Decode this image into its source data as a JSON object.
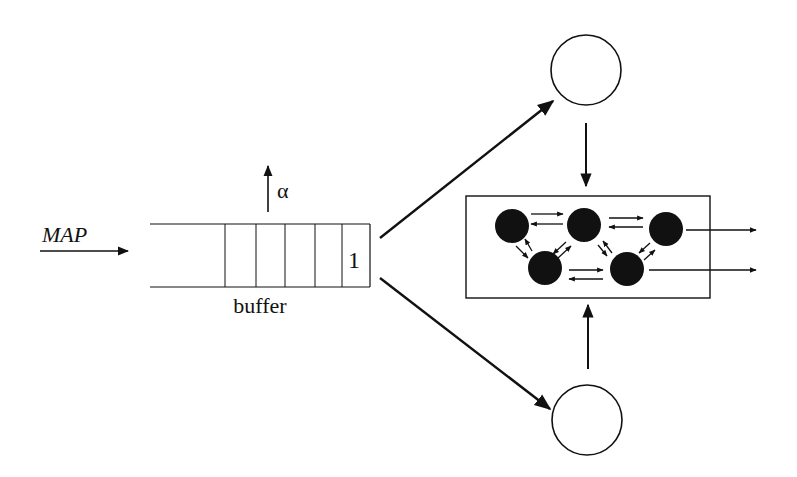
{
  "diagram": {
    "input_label": "MAP",
    "abandon_label": "α",
    "buffer_label": "buffer",
    "buffer_slot_label": "1",
    "buffer_slots": 5,
    "nodes": {
      "server_top": "server",
      "server_bottom": "server",
      "network": {
        "states": 5,
        "outputs": 2
      }
    },
    "colors": {
      "stroke": "#111111",
      "background": "#ffffff",
      "node_fill": "#111111"
    }
  }
}
